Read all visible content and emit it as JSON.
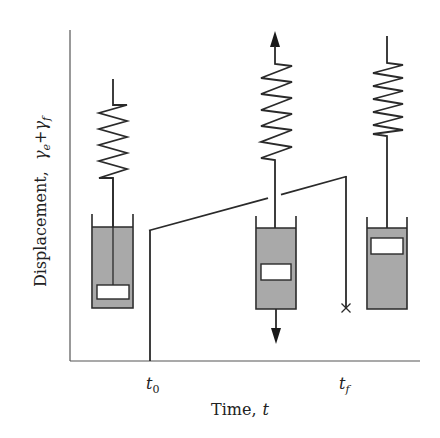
{
  "figure": {
    "x_axis": {
      "label_main": "Time,",
      "label_var": "t",
      "ticks": [
        {
          "base": "t",
          "sub": "0"
        },
        {
          "base": "t",
          "sub": "f"
        }
      ]
    },
    "y_axis": {
      "label_main": "Displacement,",
      "label_var1_base": "γ",
      "label_var1_sub": "e",
      "label_plus": "+",
      "label_var2_base": "γ",
      "label_var2_sub": "f"
    },
    "elements": [
      {
        "name": "maxwell-model-before-loading",
        "stage": "t < t0",
        "piston_position": "low"
      },
      {
        "name": "maxwell-model-under-load",
        "stage": "t0 < t < tf",
        "piston_position": "middle",
        "load_arrows": [
          "up",
          "down"
        ]
      },
      {
        "name": "maxwell-model-after-unloading",
        "stage": "t > tf",
        "piston_position": "high"
      }
    ],
    "response_curve": {
      "description": "Instant elastic jump at t0, linear viscous creep until tf, then elastic recovery at tf",
      "points": [
        [
          150,
          361
        ],
        [
          150,
          230
        ],
        [
          346,
          176
        ],
        [
          346,
          308
        ]
      ],
      "end_marker": "×"
    },
    "colors": {
      "ink": "#2a2a2a",
      "axis": "#555555",
      "fluid": "#a9a9a9",
      "background": "#ffffff"
    }
  }
}
